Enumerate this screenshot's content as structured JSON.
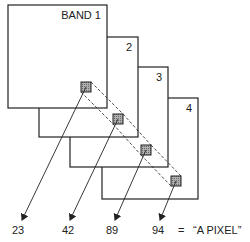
{
  "diagram": {
    "bands": [
      {
        "label": "BAND 1",
        "x": 8,
        "y": 5,
        "w": 99,
        "h": 103,
        "sq": [
          81,
          82
        ]
      },
      {
        "label": "2",
        "x": 39,
        "y": 37,
        "w": 99,
        "h": 100,
        "sq": [
          113,
          114
        ]
      },
      {
        "label": "3",
        "x": 70,
        "y": 67,
        "w": 98,
        "h": 100,
        "sq": [
          141,
          145
        ]
      },
      {
        "label": "4",
        "x": 102,
        "y": 98,
        "w": 96,
        "h": 101,
        "sq": [
          171,
          176
        ]
      }
    ],
    "values": [
      "23",
      "42",
      "89",
      "94"
    ],
    "value_x": [
      12,
      62,
      106,
      152
    ],
    "arrow_tips": [
      [
        22,
        220
      ],
      [
        70,
        220
      ],
      [
        115,
        220
      ],
      [
        160,
        220
      ]
    ],
    "equals": "=",
    "pixel_label": "“A PIXEL”",
    "colors": {
      "line": "#222222",
      "square_fill": "#9a9a9a",
      "background": "#ffffff"
    }
  }
}
